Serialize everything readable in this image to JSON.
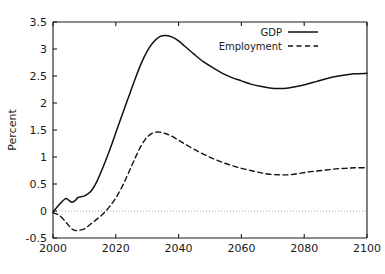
{
  "chart_data": {
    "type": "line",
    "title": "",
    "subtitle": "",
    "xlabel": "",
    "ylabel": "Percent",
    "xlim": [
      2000,
      2100
    ],
    "ylim": [
      -0.5,
      3.5
    ],
    "xticks": [
      2000,
      2020,
      2040,
      2060,
      2080,
      2100
    ],
    "xtick_labels": [
      "2000",
      "2020",
      "2040",
      "2060",
      "2080",
      "2100"
    ],
    "yticks": [
      -0.5,
      0,
      0.5,
      1,
      1.5,
      2,
      2.5,
      3,
      3.5
    ],
    "ytick_labels": [
      "-0.5",
      "0",
      "0.5",
      "1",
      "1.5",
      "2",
      "2.5",
      "3",
      "3.5"
    ],
    "grid": false,
    "zero_reference_line": 0,
    "legend_position": "top-right",
    "line_color": "#111111",
    "zero_line_color": "#9a9a9a",
    "axis_color": "#1a1a1a",
    "legend": [
      "GDP",
      "Employment"
    ],
    "x": [
      2000,
      2002,
      2004,
      2005,
      2006,
      2007,
      2008,
      2010,
      2012,
      2014,
      2016,
      2018,
      2020,
      2022,
      2024,
      2026,
      2028,
      2030,
      2032,
      2034,
      2036,
      2038,
      2040,
      2042,
      2045,
      2048,
      2051,
      2054,
      2057,
      2060,
      2063,
      2066,
      2069,
      2072,
      2075,
      2078,
      2081,
      2084,
      2087,
      2090,
      2093,
      2096,
      2100
    ],
    "series": [
      {
        "name": "GDP",
        "style": "solid",
        "values": [
          -0.02,
          0.12,
          0.23,
          0.2,
          0.16,
          0.19,
          0.25,
          0.28,
          0.36,
          0.55,
          0.82,
          1.12,
          1.45,
          1.78,
          2.1,
          2.42,
          2.72,
          2.96,
          3.13,
          3.23,
          3.25,
          3.22,
          3.15,
          3.05,
          2.9,
          2.76,
          2.65,
          2.55,
          2.47,
          2.41,
          2.35,
          2.31,
          2.28,
          2.27,
          2.28,
          2.31,
          2.35,
          2.4,
          2.45,
          2.49,
          2.52,
          2.54,
          2.55
        ]
      },
      {
        "name": "Employment",
        "style": "dashed",
        "values": [
          -0.03,
          -0.08,
          -0.2,
          -0.27,
          -0.33,
          -0.36,
          -0.36,
          -0.33,
          -0.24,
          -0.15,
          -0.05,
          0.08,
          0.24,
          0.45,
          0.7,
          0.96,
          1.2,
          1.37,
          1.45,
          1.46,
          1.43,
          1.38,
          1.31,
          1.24,
          1.14,
          1.05,
          0.97,
          0.9,
          0.84,
          0.79,
          0.75,
          0.71,
          0.68,
          0.67,
          0.67,
          0.69,
          0.72,
          0.74,
          0.76,
          0.78,
          0.79,
          0.8,
          0.8
        ]
      }
    ]
  },
  "axes": {
    "ylabel": "Percent"
  },
  "legend": {
    "items": [
      {
        "label": "GDP",
        "style": "solid"
      },
      {
        "label": "Employment",
        "style": "dashed"
      }
    ]
  }
}
